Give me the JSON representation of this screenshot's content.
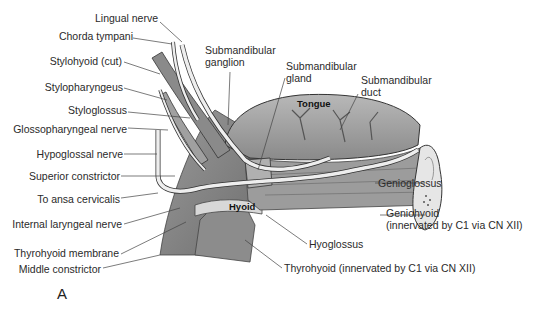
{
  "figure": {
    "panel_letter": "A",
    "inner_labels": {
      "tongue": "Tongue",
      "hyoid": "Hyoid"
    },
    "left_labels": [
      {
        "id": "lingual-nerve",
        "text": "Lingual nerve"
      },
      {
        "id": "chorda-tympani",
        "text": "Chorda tympani"
      },
      {
        "id": "stylohyoid-cut",
        "text": "Stylohyoid (cut)"
      },
      {
        "id": "stylopharyngeus",
        "text": "Stylopharyngeus"
      },
      {
        "id": "styloglossus",
        "text": "Styloglossus"
      },
      {
        "id": "glossopharyngeal-nerve",
        "text": "Glossopharyngeal nerve"
      },
      {
        "id": "hypoglossal-nerve",
        "text": "Hypoglossal nerve"
      },
      {
        "id": "superior-constrictor",
        "text": "Superior constrictor"
      },
      {
        "id": "to-ansa-cervicalis",
        "text": "To ansa cervicalis"
      },
      {
        "id": "internal-laryngeal-nerve",
        "text": "Internal laryngeal nerve"
      },
      {
        "id": "thyrohyoid-membrane",
        "text": "Thyrohyoid membrane"
      },
      {
        "id": "middle-constrictor",
        "text": "Middle constrictor"
      }
    ],
    "top_labels": [
      {
        "id": "submandibular-ganglion",
        "line1": "Submandibular",
        "line2": "ganglion"
      },
      {
        "id": "submandibular-gland",
        "line1": "Submandibular",
        "line2": "gland"
      },
      {
        "id": "submandibular-duct",
        "line1": "Submandibular",
        "line2": "duct"
      }
    ],
    "right_labels": [
      {
        "id": "genioglossus",
        "text": "Genioglossus"
      },
      {
        "id": "geniohyoid",
        "line1": "Geniohyoid",
        "line2": "(innervated by C1 via CN XII)"
      },
      {
        "id": "hyoglossus",
        "text": "Hyoglossus"
      },
      {
        "id": "thyrohyoid",
        "text": "Thyrohyoid (innervated by C1 via CN XII)"
      }
    ]
  }
}
